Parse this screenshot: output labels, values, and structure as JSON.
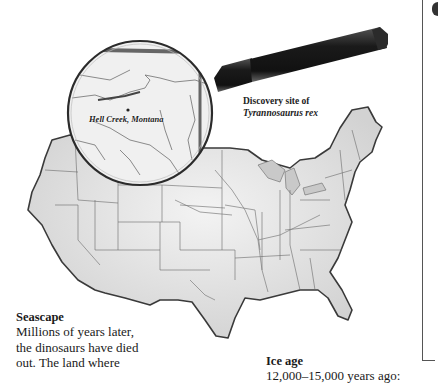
{
  "map": {
    "title": "Map of the contiguous United States",
    "magnifier_label": "Hell Creek, Montana",
    "caption_line1": "Discovery site of",
    "caption_line2": "Tyrannosaurus rex",
    "colors": {
      "land": "#e6e6e6",
      "border": "#555555",
      "outline": "#3a3a3a",
      "handle": "#1e1e1e",
      "lens_rim": "#2b2b2b"
    }
  },
  "sections": {
    "seascape": {
      "heading": "Seascape",
      "lines": [
        "Millions of years later,",
        "the dinosaurs have died",
        "out. The land where"
      ]
    },
    "iceage": {
      "heading": "Ice age",
      "line1": "12,000–15,000 years ago:"
    }
  }
}
